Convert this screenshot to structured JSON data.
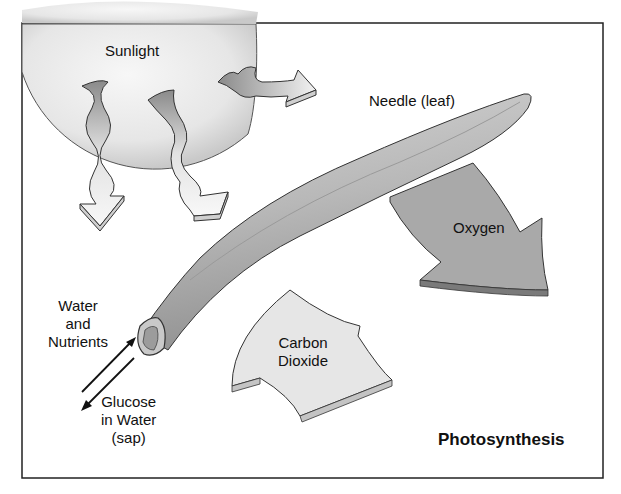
{
  "title": "Photosynthesis",
  "labels": {
    "sunlight": "Sunlight",
    "needle": "Needle (leaf)",
    "oxygen": "Oxygen",
    "carbon_dioxide_line1": "Carbon",
    "carbon_dioxide_line2": "Dioxide",
    "water_line1": "Water",
    "water_line2": "and",
    "water_line3": "Nutrients",
    "glucose_line1": "Glucose",
    "glucose_line2": "in Water",
    "glucose_line3": "(sap)"
  },
  "colors": {
    "frame": "#222222",
    "sun": "#e8e8e8",
    "needle": "#b5b5b5",
    "oxygen_arrow": "#a8a8a8",
    "co2_arrow": "#e6e6e6",
    "ray": "#d8d8d8"
  }
}
